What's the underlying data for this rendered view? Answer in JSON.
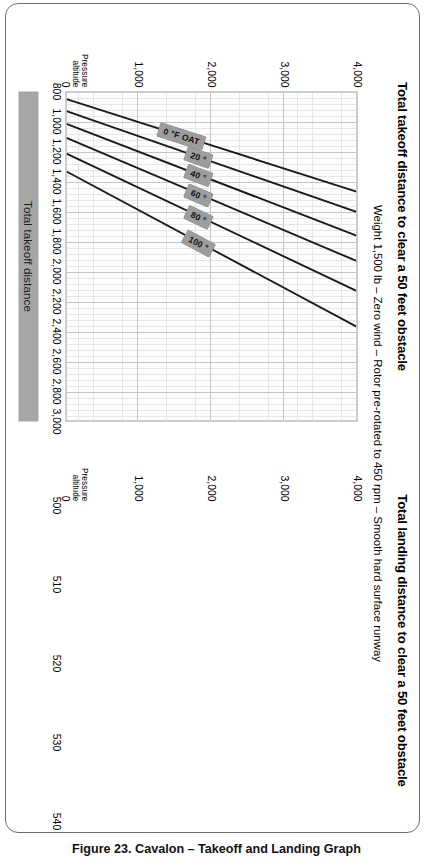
{
  "figure": {
    "caption": "Figure 23. Cavalon – Takeoff and Landing Graph",
    "subtitle": "Weight 1,500 lb – Zero wind – Rotor pre-rotated to 450 rpm – Smooth hard surface runway",
    "frame_color": "#6f6f6f",
    "band_color": "#a6a6a6",
    "label_box_color": "#9d9d9d",
    "line_color": "#1a1a1a"
  },
  "chart_data": [
    {
      "type": "line",
      "id": "takeoff",
      "title": "Total takeoff distance to clear a 50 feet obstacle",
      "subtitle": "Weight 1,500 lb – Zero wind – Rotor pre-rotated to 450 rpm – Smooth hard surface runway",
      "xlabel": "Total takeoff distance",
      "ylabel": "Pressure altitude",
      "xlim": [
        800,
        3000
      ],
      "ylim": [
        0,
        4000
      ],
      "xticks": [
        800,
        1000,
        1200,
        1400,
        1600,
        1800,
        2000,
        2200,
        2400,
        2600,
        2800,
        3000
      ],
      "xticklabels": [
        "800",
        "1,000",
        "1,200",
        "1,400",
        "1,600",
        "1,800",
        "2,000",
        "2,200",
        "2,400",
        "2,600",
        "2,800",
        "3,000"
      ],
      "yticks": [
        0,
        1000,
        2000,
        3000,
        4000
      ],
      "yticklabels": [
        "0",
        "1,000",
        "2,000",
        "3,000",
        "4,000"
      ],
      "grid": true,
      "minor_grid": true,
      "legend": "inline-labels",
      "series": [
        {
          "name": "0 °F OAT",
          "x": [
            845,
            1465
          ],
          "y": [
            0,
            4000
          ]
        },
        {
          "name": "20 °",
          "x": [
            925,
            1600
          ],
          "y": [
            0,
            4000
          ]
        },
        {
          "name": "40 °",
          "x": [
            1010,
            1760
          ],
          "y": [
            0,
            4000
          ]
        },
        {
          "name": "60 °",
          "x": [
            1105,
            1930
          ],
          "y": [
            0,
            4000
          ]
        },
        {
          "name": "80 °",
          "x": [
            1210,
            2130
          ],
          "y": [
            0,
            4000
          ]
        },
        {
          "name": "100 °",
          "x": [
            1330,
            2370
          ],
          "y": [
            0,
            4000
          ]
        }
      ]
    },
    {
      "type": "line",
      "id": "landing",
      "title": "Total landing distance to clear a 50 feet obstacle",
      "subtitle": "Weight 1,500 lb – Zero wind – Rotor pre-rotated to 450 rpm – Smooth hard surface runway",
      "xlabel": "Total landing distance",
      "ylabel": "Pressure altitude",
      "xlim": [
        500,
        540
      ],
      "ylim": [
        0,
        4000
      ],
      "xticks": [
        500,
        510,
        520,
        530,
        540
      ],
      "xticklabels": [
        "500",
        "510",
        "520",
        "530",
        "540"
      ],
      "yticks": [
        0,
        1000,
        2000,
        3000,
        4000
      ],
      "yticklabels": [
        "0",
        "1,000",
        "2,000",
        "3,000",
        "4,000"
      ],
      "grid": true,
      "minor_grid": true,
      "legend": "inline-labels",
      "series": [
        {
          "name": "0 °F OAT",
          "x": [
            500.5,
            511.5
          ],
          "y": [
            0,
            4000
          ]
        },
        {
          "name": "20 °",
          "x": [
            502.3,
            514.0
          ],
          "y": [
            0,
            4000
          ]
        },
        {
          "name": "40 °",
          "x": [
            504.1,
            516.6
          ],
          "y": [
            0,
            4000
          ]
        },
        {
          "name": "60 °",
          "x": [
            506.0,
            519.2
          ],
          "y": [
            0,
            4000
          ]
        },
        {
          "name": "80 °",
          "x": [
            508.0,
            521.9
          ],
          "y": [
            0,
            4000
          ]
        },
        {
          "name": "100 °",
          "x": [
            510.2,
            524.8
          ],
          "y": [
            0,
            4000
          ]
        }
      ]
    }
  ]
}
